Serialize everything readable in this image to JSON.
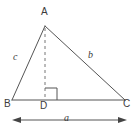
{
  "figure": {
    "kind": "geometry-diagram",
    "background_color": "#ffffff",
    "stroke_color": "#555555",
    "text_color": "#3b3b3b",
    "vertices": [
      {
        "name": "A",
        "label": "A",
        "x": 45,
        "y": 26
      },
      {
        "name": "B",
        "label": "B",
        "x": 12,
        "y": 100
      },
      {
        "name": "C",
        "label": "C",
        "x": 125,
        "y": 100
      },
      {
        "name": "D",
        "label": "D",
        "x": 45,
        "y": 100
      }
    ],
    "sides": [
      {
        "name": "side-b",
        "label": "b",
        "from": "A",
        "to": "C"
      },
      {
        "name": "side-c",
        "label": "c",
        "from": "B",
        "to": "A"
      },
      {
        "name": "side-a",
        "label": "a",
        "from": "B",
        "to": "C"
      }
    ],
    "altitude": {
      "name": "altitude-AD",
      "from": "A",
      "to": "D",
      "style": "dashed"
    },
    "right_angle": {
      "name": "right-angle-at-D",
      "at": "D",
      "size": 12
    },
    "dimension_arrow": {
      "name": "base-dimension-a",
      "label": "a",
      "from_x": 12,
      "to_x": 127,
      "y": 120
    }
  }
}
